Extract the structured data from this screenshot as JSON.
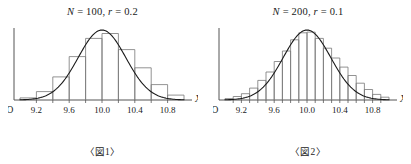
{
  "figures": [
    {
      "title_plain": "N = 100, r = 0.2",
      "title_n_symbol": "N",
      "title_n_value": " = 100, ",
      "title_r_symbol": "r",
      "title_r_value": " = 0.2",
      "caption": "〈図1〉",
      "axis_x_label": "X",
      "origin_label": "O",
      "chart_data": {
        "type": "bar",
        "title": "N = 100, r = 0.2",
        "subtitle": "〈図1〉",
        "xlabel": "X",
        "ylabel": "",
        "grid": false,
        "legend": "none",
        "overlay_curve": "normal distribution",
        "bin_width": 0.2,
        "sample_size": 100,
        "xlim": [
          9.0,
          11.0
        ],
        "ylim": [
          0,
          1.0
        ],
        "tick_labels": [
          "9.2",
          "9.6",
          "10.0",
          "10.4",
          "10.8"
        ],
        "tick_values": [
          9.2,
          9.6,
          10.0,
          10.4,
          10.8
        ],
        "minor_tick_values": [
          9.2,
          9.4,
          9.6,
          9.8,
          10.0,
          10.2,
          10.4,
          10.6,
          10.8
        ],
        "bin_starts": [
          9.0,
          9.2,
          9.4,
          9.6,
          9.8,
          10.0,
          10.2,
          10.4,
          10.6,
          10.8
        ],
        "values": [
          0.03,
          0.12,
          0.33,
          0.62,
          0.88,
          0.95,
          0.72,
          0.46,
          0.22,
          0.07
        ],
        "curve_peak_x": 10.0,
        "curve_peak_y": 1.0
      }
    },
    {
      "title_plain": "N = 200, r = 0.1",
      "title_n_symbol": "N",
      "title_n_value": " = 200, ",
      "title_r_symbol": "r",
      "title_r_value": " = 0.1",
      "caption": "〈図2〉",
      "axis_x_label": "X",
      "origin_label": "O",
      "chart_data": {
        "type": "bar",
        "title": "N = 200, r = 0.1",
        "subtitle": "〈図2〉",
        "xlabel": "X",
        "ylabel": "",
        "grid": false,
        "legend": "none",
        "overlay_curve": "normal distribution",
        "bin_width": 0.1,
        "sample_size": 200,
        "xlim": [
          9.0,
          11.0
        ],
        "ylim": [
          0,
          1.0
        ],
        "tick_labels": [
          "9.2",
          "9.6",
          "10.0",
          "10.4",
          "10.8"
        ],
        "tick_values": [
          9.2,
          9.6,
          10.0,
          10.4,
          10.8
        ],
        "minor_tick_values": [
          9.1,
          9.2,
          9.3,
          9.4,
          9.5,
          9.6,
          9.7,
          9.8,
          9.9,
          10.0,
          10.1,
          10.2,
          10.3,
          10.4,
          10.5,
          10.6,
          10.7,
          10.8,
          10.9
        ],
        "bin_starts": [
          9.0,
          9.1,
          9.2,
          9.3,
          9.4,
          9.5,
          9.6,
          9.7,
          9.8,
          9.9,
          10.0,
          10.1,
          10.2,
          10.3,
          10.4,
          10.5,
          10.6,
          10.7,
          10.8,
          10.9
        ],
        "values": [
          0.02,
          0.05,
          0.09,
          0.17,
          0.28,
          0.4,
          0.55,
          0.7,
          0.86,
          0.96,
          0.97,
          0.88,
          0.74,
          0.6,
          0.47,
          0.35,
          0.24,
          0.15,
          0.08,
          0.04
        ],
        "curve_peak_x": 10.0,
        "curve_peak_y": 1.0
      }
    }
  ],
  "style": {
    "bar_stroke": "#777777",
    "curve_stroke": "#1a1a1a",
    "axis_stroke": "#555555",
    "background": "#ffffff"
  }
}
